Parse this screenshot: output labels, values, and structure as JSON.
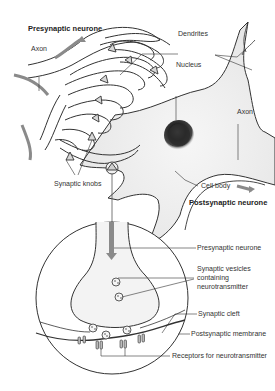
{
  "diagram": {
    "labels": {
      "presynaptic_neurone_top": "Presynaptic neurone",
      "axon_left": "Axon",
      "dendrites": "Dendrites",
      "nucleus": "Nucleus",
      "axon_right": "Axon",
      "synaptic_knobs": "Synaptic knobs",
      "cell_body": "Cell body",
      "postsynaptic_neurone": "Postsynaptic neurone",
      "presynaptic_neurone_inset": "Presynaptic neurone",
      "synaptic_vesicles_1": "Synaptic vesicles",
      "synaptic_vesicles_2": "containing",
      "synaptic_vesicles_3": "neurotransmitter",
      "synaptic_cleft": "Synaptic cleft",
      "postsynaptic_membrane": "Postsynaptic membrane",
      "receptors": "Receptors for neurotransmitter"
    },
    "colors": {
      "outline": "#333333",
      "cell_fill": "#ececec",
      "arrow": "#8a8a8a",
      "nucleus": "#2a2a2a"
    }
  }
}
